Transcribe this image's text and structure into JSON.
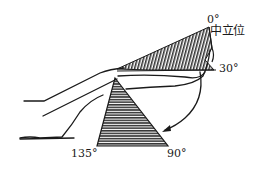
{
  "diagram": {
    "labels": {
      "zero": "0°",
      "neutral": "中立位",
      "thirty": "30°",
      "one_thirty_five": "135°",
      "ninety": "90°"
    },
    "colors": {
      "ink": "#1a1a1a",
      "background": "#ffffff"
    }
  }
}
